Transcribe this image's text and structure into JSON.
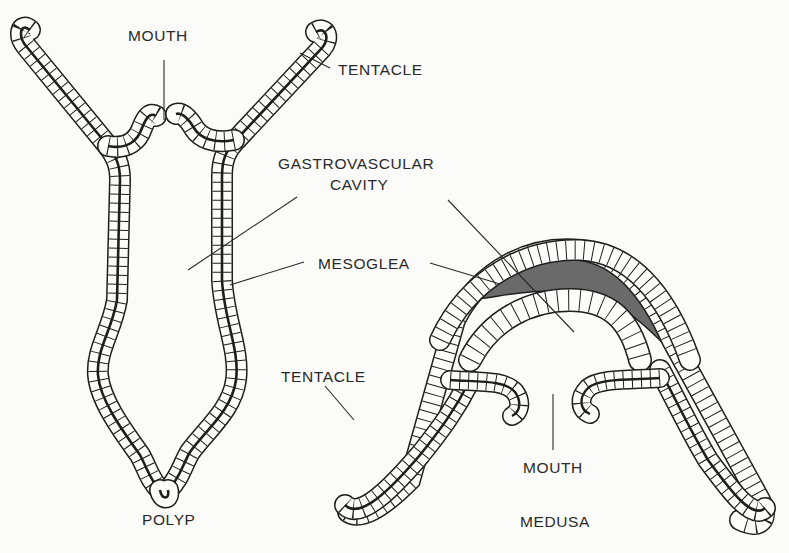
{
  "figure": {
    "type": "biological cross-section diagram",
    "background_color": "#fbfbf9",
    "line_color": "#1e1e1e",
    "mesoglea_fill": "#6b6b6b"
  },
  "polyp": {
    "caption": "POLYP",
    "labels": {
      "mouth": "MOUTH",
      "tentacle": "TENTACLE",
      "gastrovascular_cavity_line1": "GASTROVASCULAR",
      "gastrovascular_cavity_line2": "CAVITY",
      "mesoglea": "MESOGLEA"
    }
  },
  "medusa": {
    "caption": "MEDUSA",
    "labels": {
      "tentacle": "TENTACLE",
      "mouth": "MOUTH"
    }
  }
}
